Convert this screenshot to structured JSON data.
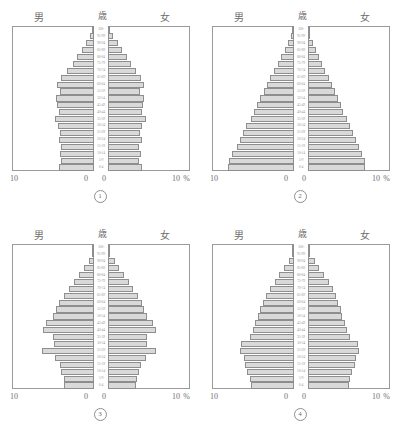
{
  "labels": {
    "male": "男",
    "age": "歳",
    "female": "女",
    "axis_outer": "10",
    "axis_zero": "0",
    "percent": "%"
  },
  "age_groups": [
    "100-",
    "95-99",
    "90-94",
    "85-89",
    "80-84",
    "75-79",
    "70-74",
    "65-69",
    "60-64",
    "55-59",
    "50-54",
    "45-49",
    "40-44",
    "35-39",
    "30-34",
    "25-29",
    "20-24",
    "15-19",
    "10-14",
    "5-9",
    "0-4"
  ],
  "chart_data": [
    {
      "type": "bar",
      "id": "1",
      "figure_label": "①",
      "title": "男 / 歳 / 女",
      "xlabel": "%",
      "ylabel": "歳",
      "xlim": [
        0,
        10
      ],
      "grid": false,
      "categories": [
        "0-4",
        "5-9",
        "10-14",
        "15-19",
        "20-24",
        "25-29",
        "30-34",
        "35-39",
        "40-44",
        "45-49",
        "50-54",
        "55-59",
        "60-64",
        "65-69",
        "70-74",
        "75-79",
        "80-84",
        "85-89",
        "90-94",
        "95-99",
        "100-"
      ],
      "series": [
        {
          "name": "男",
          "values": [
            4.3,
            4.0,
            4.2,
            4.0,
            4.3,
            4.1,
            4.4,
            4.8,
            4.3,
            4.5,
            4.6,
            4.1,
            4.5,
            4.0,
            3.3,
            2.6,
            2.1,
            1.5,
            1.0,
            0.5,
            0.2
          ]
        },
        {
          "name": "女",
          "values": [
            4.1,
            3.8,
            4.0,
            3.8,
            4.1,
            3.9,
            4.2,
            4.6,
            4.1,
            4.3,
            4.4,
            3.9,
            4.4,
            4.0,
            3.4,
            2.8,
            2.3,
            1.7,
            1.2,
            0.6,
            0.25
          ]
        }
      ]
    },
    {
      "type": "bar",
      "id": "2",
      "figure_label": "②",
      "title": "男 / 歳 / 女",
      "xlabel": "%",
      "ylabel": "歳",
      "xlim": [
        0,
        10
      ],
      "grid": false,
      "categories": [
        "0-4",
        "5-9",
        "10-14",
        "15-19",
        "20-24",
        "25-29",
        "30-34",
        "35-39",
        "40-44",
        "45-49",
        "50-54",
        "55-59",
        "60-64",
        "65-69",
        "70-74",
        "75-79",
        "80-84",
        "85-89",
        "90-94",
        "95-99",
        "100-"
      ],
      "series": [
        {
          "name": "男",
          "values": [
            8.0,
            7.9,
            7.6,
            7.0,
            6.6,
            6.2,
            5.8,
            5.3,
            4.9,
            4.5,
            4.1,
            3.7,
            3.3,
            2.9,
            2.4,
            2.0,
            1.6,
            1.1,
            0.7,
            0.35,
            0.15
          ]
        },
        {
          "name": "女",
          "values": [
            7.0,
            6.9,
            6.6,
            6.2,
            5.8,
            5.5,
            5.1,
            4.7,
            4.3,
            4.0,
            3.6,
            3.3,
            2.9,
            2.5,
            2.1,
            1.7,
            1.4,
            1.0,
            0.6,
            0.3,
            0.12
          ]
        }
      ]
    },
    {
      "type": "bar",
      "id": "3",
      "figure_label": "③",
      "title": "男 / 歳 / 女",
      "xlabel": "%",
      "ylabel": "歳",
      "xlim": [
        0,
        10
      ],
      "grid": false,
      "categories": [
        "0-4",
        "5-9",
        "10-14",
        "15-19",
        "20-24",
        "25-29",
        "30-34",
        "35-39",
        "40-44",
        "45-49",
        "50-54",
        "55-59",
        "60-64",
        "65-69",
        "70-74",
        "75-79",
        "80-84",
        "85-89",
        "90-94",
        "95-99",
        "100-"
      ],
      "series": [
        {
          "name": "男",
          "values": [
            3.6,
            3.7,
            4.0,
            4.2,
            4.8,
            6.3,
            4.9,
            5.0,
            6.2,
            5.8,
            5.0,
            4.6,
            4.3,
            3.6,
            3.0,
            2.4,
            1.8,
            1.2,
            0.6,
            0.25,
            0.1
          ]
        },
        {
          "name": "女",
          "values": [
            3.4,
            3.5,
            3.8,
            4.0,
            4.6,
            5.9,
            4.7,
            4.8,
            5.9,
            5.5,
            4.8,
            4.4,
            4.2,
            3.6,
            3.1,
            2.6,
            2.0,
            1.4,
            0.8,
            0.3,
            0.12
          ]
        }
      ]
    },
    {
      "type": "bar",
      "id": "4",
      "figure_label": "④",
      "title": "男 / 歳 / 女",
      "xlabel": "%",
      "ylabel": "歳",
      "xlim": [
        0,
        10
      ],
      "grid": false,
      "categories": [
        "0-4",
        "5-9",
        "10-14",
        "15-19",
        "20-24",
        "25-29",
        "30-34",
        "35-39",
        "40-44",
        "45-49",
        "50-54",
        "55-59",
        "60-64",
        "65-69",
        "70-74",
        "75-79",
        "80-84",
        "85-89",
        "90-94",
        "95-99",
        "100-"
      ],
      "series": [
        {
          "name": "男",
          "values": [
            5.2,
            5.4,
            5.7,
            6.0,
            6.1,
            6.6,
            6.5,
            5.4,
            5.0,
            4.7,
            4.4,
            4.1,
            3.8,
            3.4,
            2.9,
            2.3,
            1.8,
            1.2,
            0.6,
            0.25,
            0.1
          ]
        },
        {
          "name": "女",
          "values": [
            5.0,
            5.1,
            5.4,
            5.7,
            5.8,
            6.2,
            6.1,
            5.1,
            4.8,
            4.5,
            4.2,
            4.0,
            3.7,
            3.4,
            3.0,
            2.5,
            2.0,
            1.4,
            0.8,
            0.3,
            0.12
          ]
        }
      ]
    }
  ],
  "style": {
    "bar_fill": "#d9d9d9",
    "bar_stroke": "#8e8e8e",
    "frame": "#9a9a9a",
    "text": "#6e6e6e",
    "label_text": "#9d9d9d"
  }
}
